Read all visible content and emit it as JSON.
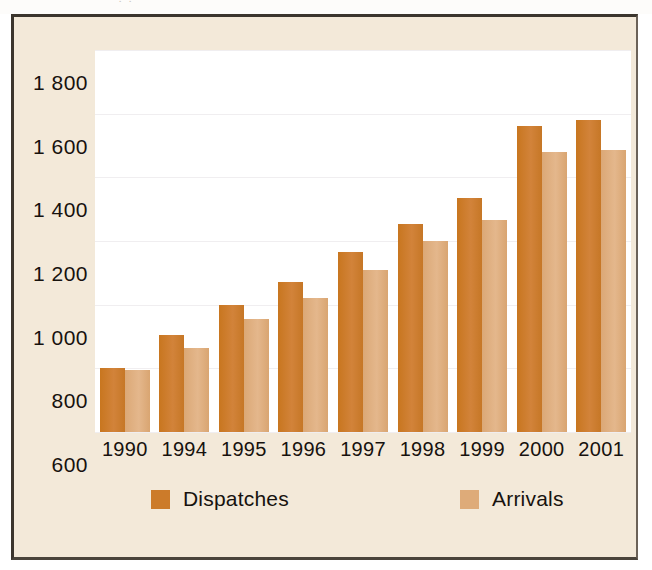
{
  "scan": {
    "top_sliver_ghost_text": "·                                      ·"
  },
  "legend": {
    "position": "bottom",
    "entries": [
      {
        "label": "Dispatches",
        "color": "#cc7b2a",
        "swatch_icon": "square-swatch-icon"
      },
      {
        "label": "Arrivals",
        "color": "#deab79",
        "swatch_icon": "square-swatch-icon"
      }
    ]
  },
  "axes": {
    "y_tick_labels": [
      "1 800",
      "1 600",
      "1 400",
      "1 200",
      "1 000",
      "800",
      "600"
    ],
    "x_tick_labels": [
      "1990",
      "1994",
      "1995",
      "1996",
      "1997",
      "1998",
      "1999",
      "2000",
      "2001"
    ]
  },
  "colors": {
    "panel_background": "#f3e9d9",
    "plot_background": "#ffffff",
    "panel_border": "#3b352d",
    "gridline": "#f0eef0",
    "dispatches": "#cc7b2a",
    "arrivals": "#deab79",
    "text": "#17120e"
  },
  "chart_data": {
    "type": "bar",
    "title": "",
    "subtitle": "",
    "xlabel": "",
    "ylabel": "",
    "categories": [
      "1990",
      "1994",
      "1995",
      "1996",
      "1997",
      "1998",
      "1999",
      "2000",
      "2001"
    ],
    "series": [
      {
        "name": "Dispatches",
        "color": "#cc7b2a",
        "values": [
          800,
          905,
          1000,
          1070,
          1165,
          1255,
          1335,
          1560,
          1580
        ]
      },
      {
        "name": "Arrivals",
        "color": "#deab79",
        "values": [
          795,
          865,
          955,
          1020,
          1110,
          1200,
          1265,
          1480,
          1485
        ]
      }
    ],
    "ylim": [
      600,
      1800
    ],
    "yticks": [
      600,
      800,
      1000,
      1200,
      1400,
      1600,
      1800
    ],
    "ytick_labels": [
      "600",
      "800",
      "1 000",
      "1 200",
      "1 400",
      "1 600",
      "1 800"
    ],
    "grid": true,
    "legend_position": "bottom",
    "annotations": []
  }
}
